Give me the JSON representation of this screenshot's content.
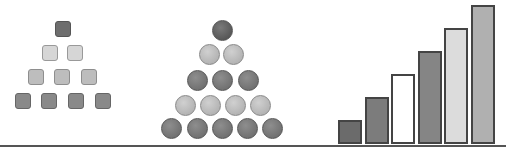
{
  "figure": {
    "square_pyramid": {
      "rows": [
        {
          "count": 1,
          "shade": "dark"
        },
        {
          "count": 2,
          "shade": "pale"
        },
        {
          "count": 3,
          "shade": "light"
        },
        {
          "count": 4,
          "shade": "mid"
        }
      ]
    },
    "circle_pyramid": {
      "rows": [
        {
          "count": 1,
          "shade": "dark"
        },
        {
          "count": 2,
          "shade": "light"
        },
        {
          "count": 3,
          "shade": "mid"
        },
        {
          "count": 4,
          "shade": "light"
        },
        {
          "count": 5,
          "shade": "mid"
        }
      ]
    },
    "bars": {
      "count": 6,
      "relative_heights": [
        1,
        2,
        3,
        4,
        5,
        6
      ],
      "fills": [
        "#6b6b6b",
        "#7c7c7c",
        "#ffffff",
        "#858585",
        "#dcdcdc",
        "#b0b0b0"
      ]
    },
    "colors": {
      "dark": "#6e6e6e",
      "mid": "#898989",
      "light": "#bdbdbd",
      "baseline": "#555555"
    }
  }
}
